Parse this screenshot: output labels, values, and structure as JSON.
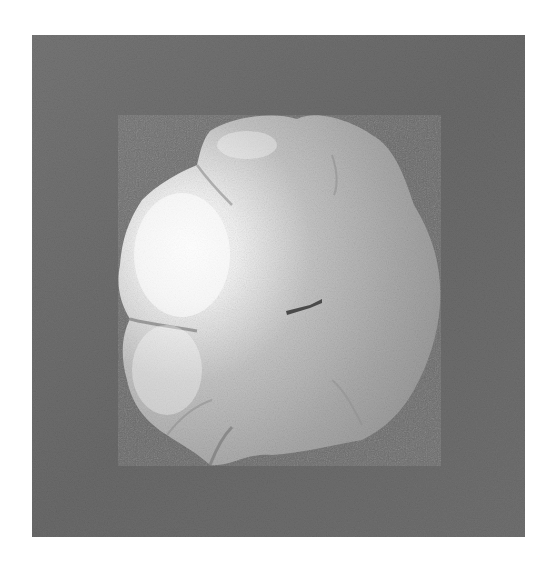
{
  "image": {
    "kind": "grayscale photograph",
    "subject": "inflated airbag cushion viewed head-on against a dark gray background",
    "colors": {
      "page_background": "#ffffff",
      "photo_background": "#6f6f6f",
      "object_highlight": "#f8f8f8",
      "object_mid": "#bdbdbd",
      "object_shadow": "#9a9a9a",
      "center_mark": "#4a4a4a"
    }
  }
}
